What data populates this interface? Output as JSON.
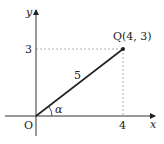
{
  "diagram": {
    "type": "coordinate-plane",
    "axes": {
      "x_label": "x",
      "y_label": "y",
      "origin_label": "O"
    },
    "ticks": {
      "x_tick": "4",
      "y_tick": "3"
    },
    "point": {
      "label": "Q(4, 3)",
      "x": 4,
      "y": 3
    },
    "segment": {
      "length_label": "5",
      "from": "O",
      "to": "Q"
    },
    "angle": {
      "label": "α"
    },
    "colors": {
      "line": "#222222",
      "dashed": "#999999"
    }
  }
}
